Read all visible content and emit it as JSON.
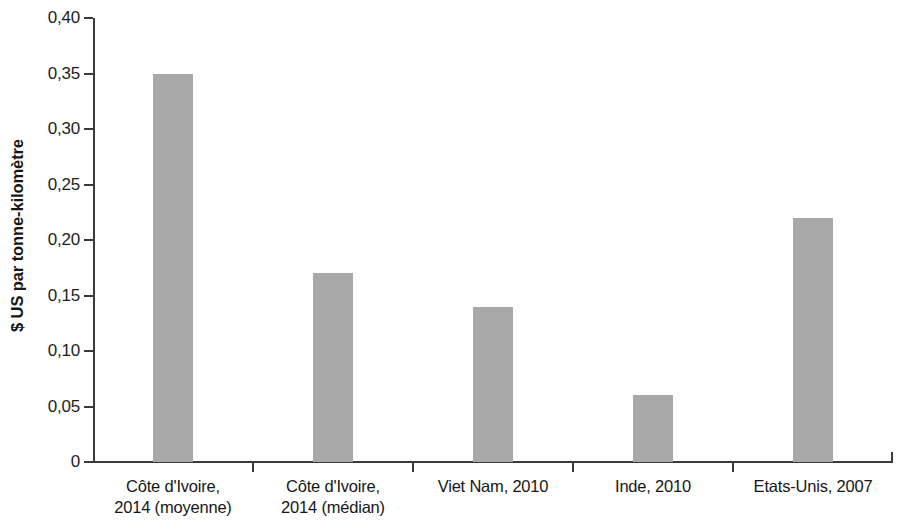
{
  "chart_data": {
    "type": "bar",
    "title": "",
    "xlabel": "",
    "ylabel": "$ US par tonne-kilomètre",
    "ylim": [
      0,
      0.4
    ],
    "grid": false,
    "legend": null,
    "bar_color": "#a8a8a8",
    "axis_color": "#3a3a3a",
    "decimal_separator": ",",
    "categories": [
      "Côte d'Ivoire, 2014 (moyenne)",
      "Côte d'Ivoire, 2014 (médian)",
      "Viet Nam, 2010",
      "Inde, 2010",
      "Etats-Unis, 2007"
    ],
    "category_lines": [
      [
        "Côte d'Ivoire,",
        "2014 (moyenne)"
      ],
      [
        "Côte d'Ivoire,",
        "2014 (médian)"
      ],
      [
        "Viet Nam, 2010",
        ""
      ],
      [
        "Inde, 2010",
        ""
      ],
      [
        "Etats-Unis, 2007",
        ""
      ]
    ],
    "values": [
      0.35,
      0.17,
      0.14,
      0.06,
      0.22
    ],
    "value_labels": [
      "0,35",
      "0,17",
      "0,14",
      "0,06",
      "0,22"
    ],
    "yticks": [
      0,
      0.05,
      0.1,
      0.15,
      0.2,
      0.25,
      0.3,
      0.35,
      0.4
    ],
    "ytick_labels": [
      "0",
      "0,05",
      "0,10",
      "0,15",
      "0,20",
      "0,25",
      "0,30",
      "0,35",
      "0,40"
    ]
  }
}
